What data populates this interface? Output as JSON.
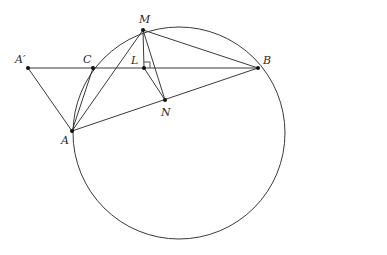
{
  "figure": {
    "type": "geometry-diagram",
    "stroke_color": "#3a3a3a",
    "circle": {
      "cx": 179,
      "cy": 133,
      "r": 106
    },
    "points": [
      {
        "id": "Aprime",
        "label": "A′",
        "x": 28,
        "y": 68,
        "label_dx": -13,
        "label_dy": -14
      },
      {
        "id": "C",
        "label": "C",
        "x": 93,
        "y": 68,
        "label_dx": -10,
        "label_dy": -14
      },
      {
        "id": "L",
        "label": "L",
        "x": 144,
        "y": 68,
        "label_dx": -13,
        "label_dy": -13
      },
      {
        "id": "M",
        "label": "M",
        "x": 143,
        "y": 30,
        "label_dx": -4,
        "label_dy": -16
      },
      {
        "id": "B",
        "label": "B",
        "x": 258,
        "y": 68,
        "label_dx": 5,
        "label_dy": -13
      },
      {
        "id": "N",
        "label": "N",
        "x": 165,
        "y": 100,
        "label_dx": -4,
        "label_dy": 7
      },
      {
        "id": "A",
        "label": "A",
        "x": 72,
        "y": 131,
        "label_dx": -11,
        "label_dy": 4
      }
    ],
    "segments": [
      [
        "Aprime",
        "B"
      ],
      [
        "Aprime",
        "A"
      ],
      [
        "A",
        "C"
      ],
      [
        "A",
        "M"
      ],
      [
        "A",
        "B"
      ],
      [
        "M",
        "L"
      ],
      [
        "M",
        "N"
      ],
      [
        "M",
        "B"
      ],
      [
        "L",
        "N"
      ]
    ],
    "right_angle": {
      "at": "L",
      "size": 6
    }
  }
}
